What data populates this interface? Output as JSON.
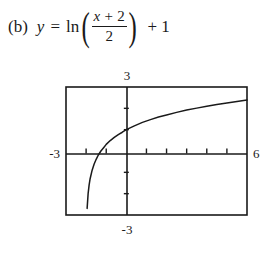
{
  "problem": {
    "part_label": "(b)",
    "lhs_variable": "y",
    "equals": "=",
    "function_name": "ln",
    "paren_open": "(",
    "paren_close": ")",
    "numerator": "x + 2",
    "numerator_var": "x",
    "numerator_rest": "+ 2",
    "denominator": "2",
    "trailing_term": "+ 1"
  },
  "chart_data": {
    "type": "line",
    "title": "",
    "xlabel": "",
    "ylabel": "",
    "expression": "y = ln((x + 2)/2) + 1",
    "xlim": [
      -3,
      6
    ],
    "ylim": [
      -3,
      3
    ],
    "grid": false,
    "legend": false,
    "axis_labels": {
      "left": "-3",
      "right": "6",
      "top": "3",
      "bottom": "-3"
    },
    "tick_spacing": 1,
    "vertical_asymptote": -2,
    "x_intercept": -1.264,
    "y_intercept": 1.0,
    "x": [
      -1.95,
      -1.9,
      -1.85,
      -1.8,
      -1.7,
      -1.6,
      -1.5,
      -1.4,
      -1.264,
      -1.1,
      -1.0,
      -0.8,
      -0.6,
      -0.4,
      -0.2,
      0.0,
      0.4,
      0.8,
      1.2,
      1.6,
      2.0,
      2.5,
      3.0,
      3.5,
      4.0,
      4.5,
      5.0,
      5.5,
      6.0
    ],
    "y": [
      -2.69,
      -2.0,
      -1.59,
      -1.3,
      -0.9,
      -0.61,
      -0.39,
      -0.2,
      0.0,
      0.19,
      0.31,
      0.49,
      0.64,
      0.77,
      0.88,
      1.0,
      1.18,
      1.34,
      1.47,
      1.59,
      1.69,
      1.81,
      1.92,
      2.01,
      2.1,
      2.18,
      2.25,
      2.32,
      2.39
    ]
  }
}
